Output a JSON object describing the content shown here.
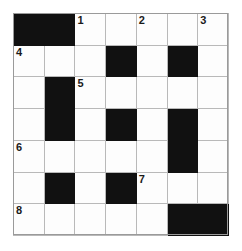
{
  "puzzle": {
    "type": "crossword-grid",
    "rows": 7,
    "cols": 7,
    "colors": {
      "block": "#111111",
      "cell": "#fdfdfd",
      "grid_line": "#b9b9b9",
      "number_text": "#1a1a1a",
      "page_background": "#ffffff"
    },
    "cells": [
      [
        {
          "block": true,
          "num": ""
        },
        {
          "block": true,
          "num": ""
        },
        {
          "block": false,
          "num": "1"
        },
        {
          "block": false,
          "num": ""
        },
        {
          "block": false,
          "num": "2"
        },
        {
          "block": false,
          "num": ""
        },
        {
          "block": false,
          "num": "3"
        }
      ],
      [
        {
          "block": false,
          "num": "4"
        },
        {
          "block": false,
          "num": ""
        },
        {
          "block": false,
          "num": ""
        },
        {
          "block": true,
          "num": ""
        },
        {
          "block": false,
          "num": ""
        },
        {
          "block": true,
          "num": ""
        },
        {
          "block": false,
          "num": ""
        }
      ],
      [
        {
          "block": false,
          "num": ""
        },
        {
          "block": true,
          "num": ""
        },
        {
          "block": false,
          "num": "5"
        },
        {
          "block": false,
          "num": ""
        },
        {
          "block": false,
          "num": ""
        },
        {
          "block": false,
          "num": ""
        },
        {
          "block": false,
          "num": ""
        }
      ],
      [
        {
          "block": false,
          "num": ""
        },
        {
          "block": true,
          "num": ""
        },
        {
          "block": false,
          "num": ""
        },
        {
          "block": true,
          "num": ""
        },
        {
          "block": false,
          "num": ""
        },
        {
          "block": true,
          "num": ""
        },
        {
          "block": false,
          "num": ""
        }
      ],
      [
        {
          "block": false,
          "num": "6"
        },
        {
          "block": false,
          "num": ""
        },
        {
          "block": false,
          "num": ""
        },
        {
          "block": false,
          "num": ""
        },
        {
          "block": false,
          "num": ""
        },
        {
          "block": true,
          "num": ""
        },
        {
          "block": false,
          "num": ""
        }
      ],
      [
        {
          "block": false,
          "num": ""
        },
        {
          "block": true,
          "num": ""
        },
        {
          "block": false,
          "num": ""
        },
        {
          "block": true,
          "num": ""
        },
        {
          "block": false,
          "num": "7"
        },
        {
          "block": false,
          "num": ""
        },
        {
          "block": false,
          "num": ""
        }
      ],
      [
        {
          "block": false,
          "num": "8"
        },
        {
          "block": false,
          "num": ""
        },
        {
          "block": false,
          "num": ""
        },
        {
          "block": false,
          "num": ""
        },
        {
          "block": false,
          "num": ""
        },
        {
          "block": true,
          "num": ""
        },
        {
          "block": true,
          "num": ""
        }
      ]
    ],
    "clue_numbers": [
      "1",
      "2",
      "3",
      "4",
      "5",
      "6",
      "7",
      "8"
    ]
  }
}
